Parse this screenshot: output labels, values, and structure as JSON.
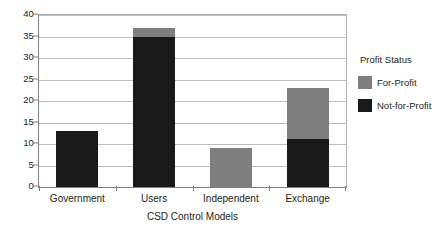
{
  "chart_data": {
    "type": "bar",
    "subtype": "stacked-bar",
    "title": "",
    "xlabel": "CSD Control Models",
    "ylabel": "",
    "categories": [
      "Government",
      "Users",
      "Independent",
      "Exchange"
    ],
    "series": [
      {
        "name": "Not-for-Profit",
        "color": "#1a1a1a",
        "values": [
          13,
          35,
          0,
          11.2
        ]
      },
      {
        "name": "For-Profit",
        "color": "#7f7f7f",
        "values": [
          0,
          2,
          9,
          11.8
        ]
      }
    ],
    "totals": [
      13,
      37,
      9,
      23
    ],
    "ylim": [
      0,
      40
    ],
    "ytick_step": 5,
    "yticks": [
      0,
      5,
      10,
      15,
      20,
      25,
      30,
      35,
      40
    ],
    "ytick_labels": [
      "0",
      "5",
      "10",
      "15",
      "20",
      "25",
      "30",
      "35",
      "40"
    ],
    "grid": "horizontal",
    "legend": {
      "title": "Profit Status",
      "position": "right",
      "entries": [
        {
          "label": "For-Profit",
          "color": "#7f7f7f"
        },
        {
          "label": "Not-for-Profit",
          "color": "#1a1a1a"
        }
      ]
    }
  }
}
